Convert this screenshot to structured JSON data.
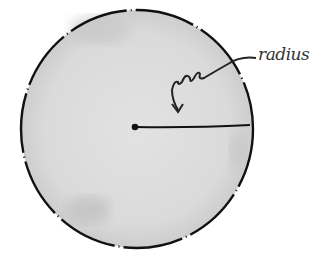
{
  "diagram": {
    "label": "radius",
    "colors": {
      "fill": "#dddddd",
      "shade": "#c8c8c8",
      "stroke": "#111111",
      "background": "#ffffff"
    },
    "circle": {
      "cx": 137,
      "cy": 129,
      "rx": 116,
      "ry": 119
    },
    "center_point": {
      "x": 135,
      "y": 127
    },
    "radius_line_end": {
      "x": 250,
      "y": 126
    }
  }
}
